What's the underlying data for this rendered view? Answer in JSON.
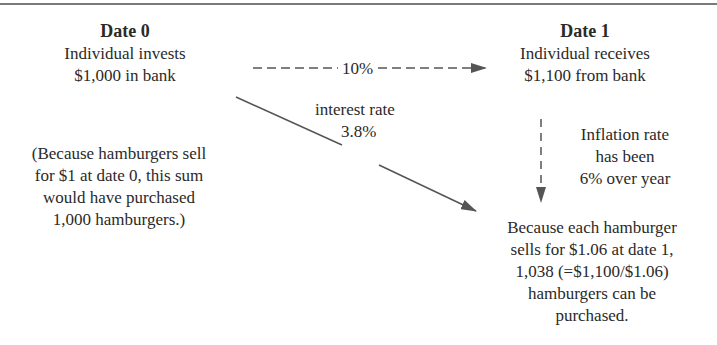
{
  "diagram": {
    "date0": {
      "heading": "Date 0",
      "line1": "Individual invests",
      "line2": "$1,000 in bank"
    },
    "date0_note": {
      "line1": "(Because hamburgers sell",
      "line2": "for $1 at date 0, this sum",
      "line3": "would have purchased",
      "line4": "1,000 hamburgers.)"
    },
    "date1": {
      "heading": "Date 1",
      "line1": "Individual receives",
      "line2": "$1,100 from bank"
    },
    "nominal_arrow": {
      "label": "10%",
      "style": "dashed"
    },
    "interest_label": "interest rate",
    "real_arrow": {
      "label": "3.8%",
      "style": "solid"
    },
    "inflation": {
      "line1": "Inflation rate",
      "line2": "has been",
      "line3": "6% over year"
    },
    "result": {
      "line1": "Because each hamburger",
      "line2": "sells for $1.06 at date 1,",
      "line3": "1,038 (=$1,100/$1.06)",
      "line4": "hamburgers can be",
      "line5": "purchased."
    },
    "colors": {
      "text": "#2a2a2a",
      "arrow": "#555555",
      "rule": "#7a7a7a"
    }
  }
}
